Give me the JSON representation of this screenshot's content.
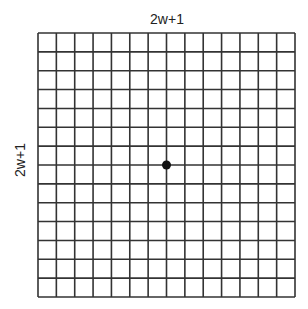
{
  "labels": {
    "top": "2w+1",
    "left": "2w+1"
  },
  "grid": {
    "columns": 14,
    "rows": 14,
    "x0": 38,
    "y0": 33,
    "width": 257,
    "height": 264,
    "line_color": "#333333"
  },
  "center_point": {
    "column_line": 7,
    "row_line": 7,
    "color": "#111111"
  }
}
